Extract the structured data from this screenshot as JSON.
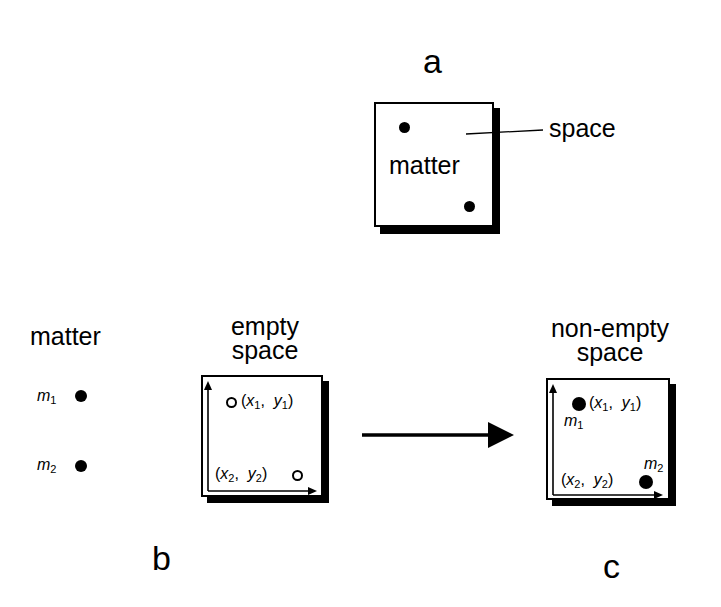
{
  "panels": {
    "a": {
      "label": "a",
      "inner_text": "matter",
      "callout": "space"
    },
    "b": {
      "label": "b",
      "matter_heading": "matter",
      "matter_items": [
        {
          "name": "m",
          "sub": "1"
        },
        {
          "name": "m",
          "sub": "2"
        }
      ],
      "space_heading_line1": "empty",
      "space_heading_line2": "space",
      "points": [
        {
          "x": "x",
          "xs": "1",
          "y": "y",
          "ys": "1"
        },
        {
          "x": "x",
          "xs": "2",
          "y": "y",
          "ys": "2"
        }
      ]
    },
    "c": {
      "label": "c",
      "space_heading_line1": "non-empty",
      "space_heading_line2": "space",
      "points": [
        {
          "x": "x",
          "xs": "1",
          "y": "y",
          "ys": "1",
          "mass": "m",
          "ms": "1"
        },
        {
          "x": "x",
          "xs": "2",
          "y": "y",
          "ys": "2",
          "mass": "m",
          "ms": "2"
        }
      ]
    }
  },
  "colors": {
    "ink": "#000000",
    "paper": "#ffffff"
  }
}
